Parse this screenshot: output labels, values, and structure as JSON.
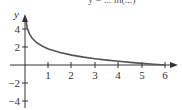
{
  "chart_data": {
    "type": "line",
    "title": "y = ... ln(...)",
    "title_note": "equation text is cropped at top edge; only partial glyphs visible",
    "xlabel": "",
    "ylabel": "y",
    "x_ticks": [
      1,
      2,
      3,
      4,
      5,
      6
    ],
    "x_tick_labels": [
      "1",
      "2",
      "3",
      "4",
      "5",
      "6"
    ],
    "y_ticks": [
      4,
      2,
      -2,
      -4
    ],
    "y_tick_labels": [
      "4",
      "2",
      "−2",
      "−4"
    ],
    "xlim": [
      0,
      6.3
    ],
    "ylim": [
      -4.5,
      5
    ],
    "grid": false,
    "legend": null,
    "series": [
      {
        "name": "curve",
        "color": "#555555",
        "x": [
          0.05,
          0.1,
          0.2,
          0.3,
          0.5,
          0.75,
          1,
          1.5,
          2,
          2.5,
          3,
          3.5,
          4,
          4.5,
          5,
          5.5,
          6
        ],
        "y": [
          4.79,
          4.09,
          3.4,
          3.0,
          2.48,
          2.08,
          1.79,
          1.39,
          1.1,
          0.88,
          0.69,
          0.54,
          0.41,
          0.29,
          0.18,
          0.09,
          0.0
        ]
      }
    ],
    "annotations": [
      "x-axis arrow at right end",
      "y-axis arrow at top"
    ]
  },
  "labels": {
    "y_axis": "y",
    "x": [
      "1",
      "2",
      "3",
      "4",
      "5",
      "6"
    ],
    "y": [
      "4",
      "2",
      "−2",
      "−4"
    ]
  },
  "colors": {
    "axis": "#333333",
    "curve": "#555555",
    "background": "#ffffff"
  }
}
